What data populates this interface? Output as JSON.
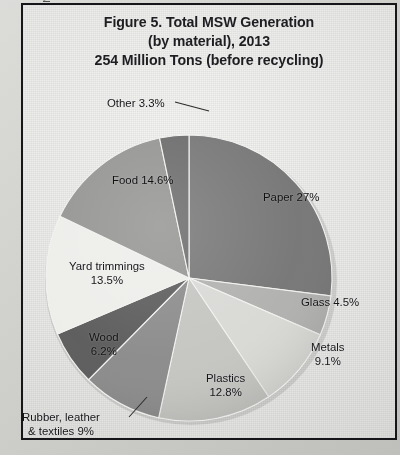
{
  "gutter_caption": "Figure 5, pp7, U.S. Environmental Protection Agency",
  "figure": {
    "title_line_1": "Figure 5. Total MSW Generation",
    "title_line_2": "(by material), 2013",
    "title_line_3": "254 Million Tons (before recycling)"
  },
  "chart_data": {
    "type": "pie",
    "total_label": "254 Million Tons (before recycling)",
    "units": "percent of total generation",
    "legend": "none (labels placed on/near slices)",
    "start_angle_deg": 0,
    "direction": "clockwise",
    "categories": [
      "Paper",
      "Glass",
      "Metals",
      "Plastics",
      "Rubber, leather & textiles",
      "Wood",
      "Yard trimmings",
      "Food",
      "Other"
    ],
    "values": [
      27,
      4.5,
      9.1,
      12.8,
      9,
      6.2,
      13.5,
      14.6,
      3.3
    ],
    "slices": [
      {
        "name": "Paper",
        "value": 27,
        "label": "Paper 27%",
        "label_lines": [
          "Paper 27%"
        ],
        "color": "#757575"
      },
      {
        "name": "Glass",
        "value": 4.5,
        "label": "Glass 4.5%",
        "label_lines": [
          "Glass 4.5%"
        ],
        "color": "#b0b0ae"
      },
      {
        "name": "Metals",
        "value": 9.1,
        "label": "Metals 9.1%",
        "label_lines": [
          "Metals",
          "9.1%"
        ],
        "color": "#d8d8d5"
      },
      {
        "name": "Plastics",
        "value": 12.8,
        "label": "Plastics 12.8%",
        "label_lines": [
          "Plastics",
          "12.8%"
        ],
        "color": "#c4c4c1"
      },
      {
        "name": "Rubber, leather & textiles",
        "value": 9,
        "label": "Rubber, leather & textiles 9%",
        "label_lines": [
          "Rubber, leather",
          "& textiles 9%"
        ],
        "color": "#8a8a8a"
      },
      {
        "name": "Wood",
        "value": 6.2,
        "label": "Wood 6.2%",
        "label_lines": [
          "Wood",
          "6.2%"
        ],
        "color": "#5a5a5a"
      },
      {
        "name": "Yard trimmings",
        "value": 13.5,
        "label": "Yard trimmings 13.5%",
        "label_lines": [
          "Yard trimmings",
          "13.5%"
        ],
        "color": "#ededea"
      },
      {
        "name": "Food",
        "value": 14.6,
        "label": "Food 14.6%",
        "label_lines": [
          "Food 14.6%"
        ],
        "color": "#939391"
      },
      {
        "name": "Other",
        "value": 3.3,
        "label": "Other 3.3%",
        "label_lines": [
          "Other 3.3%"
        ],
        "color": "#6a6a6a"
      }
    ]
  }
}
